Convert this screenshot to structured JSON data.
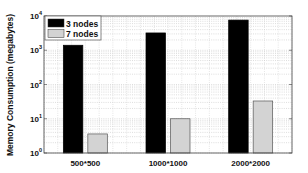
{
  "chart_data": {
    "type": "bar",
    "title": "",
    "xlabel": "",
    "ylabel": "Memory Consumption (megabytes)",
    "yscale": "log",
    "ylim": [
      1,
      10000
    ],
    "yticks": [
      {
        "base": "10",
        "exp": "0"
      },
      {
        "base": "10",
        "exp": "1"
      },
      {
        "base": "10",
        "exp": "2"
      },
      {
        "base": "10",
        "exp": "3"
      },
      {
        "base": "10",
        "exp": "4"
      }
    ],
    "categories": [
      "500*500",
      "1000*1000",
      "2000*2000"
    ],
    "series": [
      {
        "name": "3 nodes",
        "color": "#000000",
        "values": [
          1400,
          3200,
          7600
        ]
      },
      {
        "name": "7 nodes",
        "color": "#d3d3d3",
        "values": [
          3.6,
          10,
          33
        ]
      }
    ],
    "grid": true,
    "legend_position": "upper left"
  }
}
